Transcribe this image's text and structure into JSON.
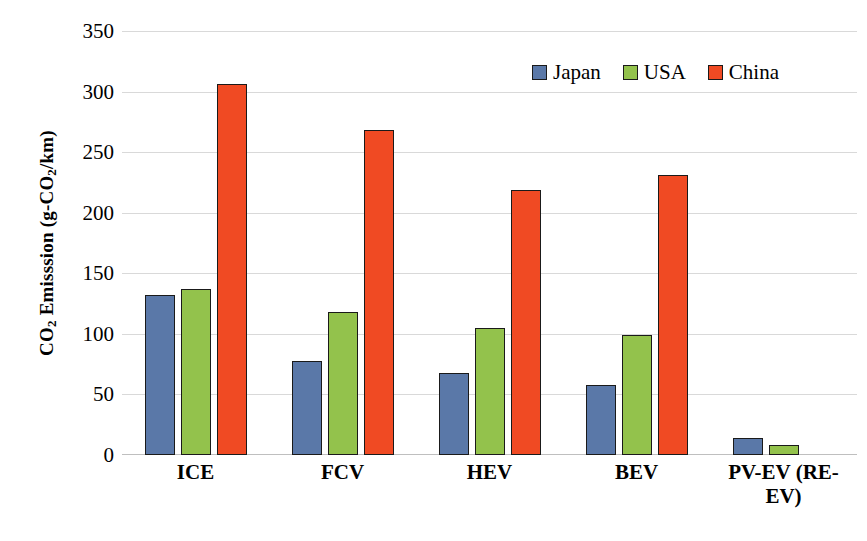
{
  "chart_data": {
    "type": "bar",
    "title": "",
    "xlabel": "",
    "ylabel": "CO2 Emisssion (g-CO2/km)",
    "ylabel_parts": {
      "pre": "CO",
      "sub1": "2",
      "mid": " Emisssion (g-CO",
      "sub2": "2",
      "post": "/km)"
    },
    "categories": [
      "ICE",
      "FCV",
      "HEV",
      "BEV",
      "PV-EV (RE-EV)"
    ],
    "series": [
      {
        "name": "Japan",
        "color": "#5A78A8",
        "values": [
          132,
          78,
          68,
          58,
          14
        ]
      },
      {
        "name": "USA",
        "color": "#93C24C",
        "values": [
          137,
          118,
          105,
          99,
          8
        ]
      },
      {
        "name": "China",
        "color": "#F04A23",
        "values": [
          306,
          268,
          219,
          231,
          null
        ]
      }
    ],
    "ylim": [
      0,
      350
    ],
    "ytick_values": [
      350,
      300,
      250,
      200,
      150,
      100,
      50,
      0
    ],
    "ytick_labels": [
      "350",
      "300",
      "250",
      "200",
      "150",
      "100",
      "50",
      "0"
    ],
    "grid": "horizontal",
    "legend_position": "top-right",
    "annotations": []
  },
  "legend": {
    "items": [
      {
        "label": "Japan",
        "color": "#5A78A8"
      },
      {
        "label": "USA",
        "color": "#93C24C"
      },
      {
        "label": "China",
        "color": "#F04A23"
      }
    ]
  },
  "caption": {
    "partial_text": ""
  }
}
